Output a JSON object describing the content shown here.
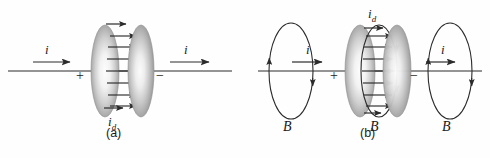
{
  "figure": {
    "type": "physics-diagram",
    "background_color": "#fefefe",
    "line_color": "#2b2b2b",
    "plate_edge_color": "#9a9a9a",
    "plate_center_color": "#fbfbfb",
    "wire_baseline_y": 71
  },
  "panels": [
    {
      "id": "a",
      "caption": "(a)",
      "caption_pos": {
        "x": 112,
        "y": 136
      },
      "wire": {
        "x1": 8,
        "x2": 232,
        "y": 71
      },
      "plates": [
        {
          "name": "left-plate",
          "cx": 105,
          "cy": 71,
          "rx": 14,
          "ry": 46,
          "polarity": "+"
        },
        {
          "name": "right-plate",
          "cx": 140,
          "cy": 71,
          "rx": 13,
          "ry": 46,
          "polarity": "-"
        }
      ],
      "polarity_labels": [
        {
          "text": "+",
          "x": 80,
          "y": 79
        },
        {
          "text": "−",
          "x": 160,
          "y": 79
        }
      ],
      "current_labels": [
        {
          "text": "i",
          "x": 47,
          "y": 53,
          "arrow": {
            "x1": 33,
            "x2": 72,
            "y": 62
          }
        },
        {
          "text": "i",
          "x": 186,
          "y": 53,
          "arrow": {
            "x1": 170,
            "x2": 211,
            "y": 62
          }
        }
      ],
      "displacement_label": {
        "text": "i",
        "sub": "d",
        "x": 112,
        "y": 125,
        "arrow": {
          "x1": 104,
          "x2": 124,
          "y": 107
        }
      },
      "top_arrow": {
        "x1": 106,
        "x2": 128,
        "y": 24
      },
      "field_arrows_count": 7,
      "field_arrow_label": "E-field arrows between plates"
    },
    {
      "id": "b",
      "caption": "(b)",
      "caption_pos": {
        "x": 366,
        "y": 136
      },
      "wire": {
        "x1": 258,
        "x2": 482,
        "y": 71
      },
      "plates": [
        {
          "name": "left-plate",
          "cx": 360,
          "cy": 71,
          "rx": 15,
          "ry": 46,
          "polarity": "+"
        },
        {
          "name": "right-plate",
          "cx": 396,
          "cy": 71,
          "rx": 14,
          "ry": 46,
          "polarity": "-"
        }
      ],
      "polarity_labels": [
        {
          "text": "+",
          "x": 334,
          "y": 79
        },
        {
          "text": "−",
          "x": 414,
          "y": 79
        }
      ],
      "current_labels": [
        {
          "text": "i",
          "x": 308,
          "y": 53,
          "arrow": {
            "x1": 292,
            "x2": 324,
            "y": 62
          }
        },
        {
          "text": "i",
          "x": 443,
          "y": 53,
          "arrow": {
            "x1": 426,
            "x2": 457,
            "y": 62
          }
        }
      ],
      "displacement_label": {
        "text": "i",
        "sub": "d",
        "x": 372,
        "y": 17,
        "arrow": {
          "x1": 364,
          "x2": 384,
          "y": 28
        }
      },
      "b_field_loops": [
        {
          "name": "left-b-loop",
          "cx": 291,
          "cy": 71,
          "rx": 22,
          "ry": 48
        },
        {
          "name": "center-b-loop",
          "cx": 379,
          "cy": 71,
          "rx": 18,
          "ry": 46
        },
        {
          "name": "right-b-loop",
          "cx": 450,
          "cy": 71,
          "rx": 22,
          "ry": 48
        }
      ],
      "b_labels": [
        {
          "text": "B",
          "x": 286,
          "y": 130
        },
        {
          "text": "B",
          "x": 373,
          "y": 130
        },
        {
          "text": "B",
          "x": 445,
          "y": 130
        }
      ],
      "field_arrows_count": 7
    }
  ]
}
